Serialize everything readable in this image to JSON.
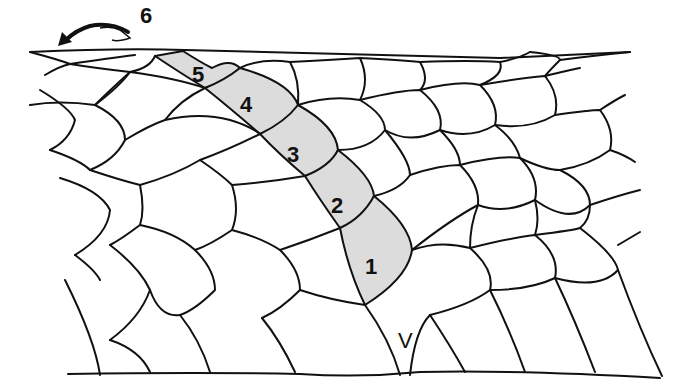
{
  "diagram": {
    "colors": {
      "line": "#111111",
      "highlight_fill": "#dcdcdc",
      "background": "#ffffff"
    },
    "labels": {
      "row1": "1",
      "row2": "2",
      "row3": "3",
      "row4": "4",
      "row5": "5",
      "row6": "6",
      "ventral": "V"
    },
    "arrow": {
      "icon": "curved-arrow-left-icon",
      "points_to": "6"
    }
  }
}
